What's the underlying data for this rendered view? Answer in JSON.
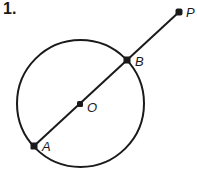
{
  "problem": {
    "number": "1."
  },
  "diagram": {
    "stroke_color": "#1a1a1a",
    "circle": {
      "center": "O",
      "cx": 80.5,
      "cy": 103.5,
      "r": 63.5
    },
    "points": [
      {
        "name": "P",
        "label": "P",
        "x": 179,
        "y": 12
      },
      {
        "name": "B",
        "label": "B",
        "x": 127,
        "y": 60
      },
      {
        "name": "O",
        "label": "O",
        "x": 80,
        "y": 104
      },
      {
        "name": "A",
        "label": "A",
        "x": 34,
        "y": 146
      }
    ],
    "segments": [
      {
        "from": "A",
        "to": "P"
      }
    ]
  }
}
